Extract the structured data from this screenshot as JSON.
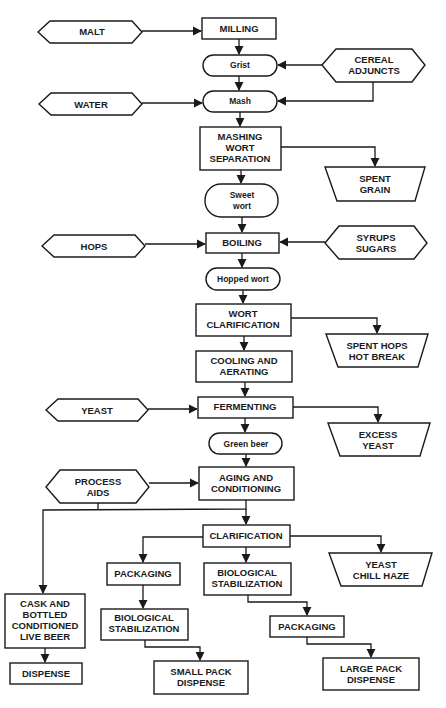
{
  "diagram": {
    "colors": {
      "ink": "#1a1a1a",
      "background": "#ffffff"
    },
    "inputs": {
      "malt": "MALT",
      "cereal_adjuncts": [
        "CEREAL",
        "ADJUNCTS"
      ],
      "water": "WATER",
      "hops": "HOPS",
      "syrups_sugars": [
        "SYRUPS",
        "SUGARS"
      ],
      "yeast": "YEAST",
      "process_aids": [
        "PROCESS",
        "AIDS"
      ]
    },
    "processes": {
      "milling": "MILLING",
      "mashing_wort_separation": [
        "MASHING",
        "WORT",
        "SEPARATION"
      ],
      "boiling": "BOILING",
      "wort_clarification": [
        "WORT",
        "CLARIFICATION"
      ],
      "cooling_aerating": [
        "COOLING AND",
        "AERATING"
      ],
      "fermenting": "FERMENTING",
      "aging_conditioning": [
        "AGING AND",
        "CONDITIONING"
      ],
      "clarification": "CLARIFICATION",
      "packaging_left": "PACKAGING",
      "bio_stab_mid": [
        "BIOLOGICAL",
        "STABILIZATION"
      ],
      "cask_bottled": [
        "CASK AND",
        "BOTTLED",
        "CONDITIONED",
        "LIVE BEER"
      ],
      "bio_stab_left": [
        "BIOLOGICAL",
        "STABILIZATION"
      ],
      "packaging_right": "PACKAGING",
      "dispense": "DISPENSE",
      "small_pack_dispense": [
        "SMALL PACK",
        "DISPENSE"
      ],
      "large_pack_dispense": [
        "LARGE PACK",
        "DISPENSE"
      ]
    },
    "intermediates": {
      "grist": "Grist",
      "mash": "Mash",
      "sweet_wort": [
        "Sweet",
        "wort"
      ],
      "hopped_wort": "Hopped wort",
      "green_beer": "Green beer"
    },
    "outputs": {
      "spent_grain": [
        "SPENT",
        "GRAIN"
      ],
      "spent_hops_hot_break": [
        "SPENT HOPS",
        "HOT BREAK"
      ],
      "excess_yeast": [
        "EXCESS",
        "YEAST"
      ],
      "yeast_chill_haze": [
        "YEAST",
        "CHILL HAZE"
      ]
    }
  }
}
